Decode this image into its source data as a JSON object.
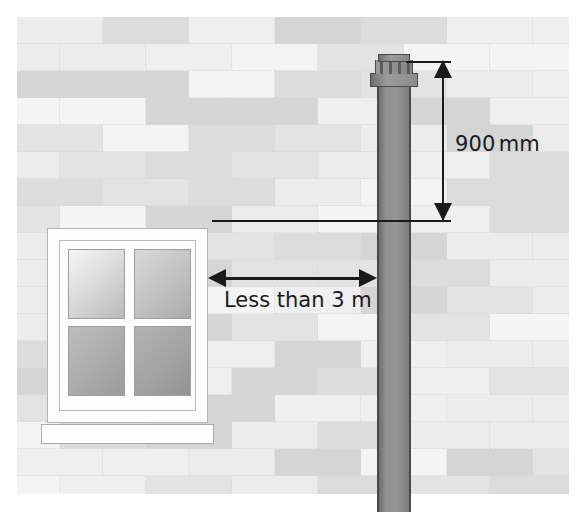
{
  "diagram": {
    "background_color": "#ffffff"
  },
  "wall": {
    "name": "brick-wall",
    "pattern": "running-bond",
    "base_color": "#f2f2f2",
    "mortar_color": "#d8d8d8",
    "brick_shades": [
      "#f4f4f4",
      "#ececec",
      "#e3e3e3",
      "#dcdcdc",
      "#d5d5d5",
      "#efefef"
    ],
    "brick_width": 86,
    "brick_height": 27,
    "rows": 18
  },
  "window": {
    "name": "window",
    "frame_color": "#fdfdfd",
    "frame_outline": "#b4b4b4",
    "pane_count": 4,
    "panes": [
      "top-left",
      "top-right",
      "bottom-left",
      "bottom-right"
    ],
    "sill": "window-sill"
  },
  "flue": {
    "name": "flue-pipe",
    "pipe_color": "#8f8f8f",
    "outline_color": "#4a4a4a",
    "terminal": "flue-terminal-cap",
    "terminal_slats": 4
  },
  "annotations": {
    "vertical": {
      "label": "900",
      "unit": "mm",
      "full_text": "900 mm",
      "arrow_style": "double-headed",
      "color": "#1a1a1a",
      "measures": "height of flue terminal above reference line"
    },
    "horizontal": {
      "label": "Less than 3 m",
      "arrow_style": "double-headed",
      "color": "#1a1a1a",
      "measures": "horizontal distance from window to flue pipe"
    }
  }
}
